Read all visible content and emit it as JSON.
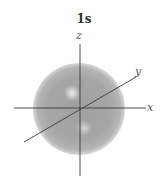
{
  "figure": {
    "title": "1s",
    "axes": {
      "x_label": "x",
      "y_label": "y",
      "z_label": "z"
    },
    "colors": {
      "sphere_edge": "#9a9a9a",
      "sphere_mid": "#a8a8a8",
      "highlight": "#e6e6e6",
      "axis_line": "#3a3a3a",
      "label": "#555555"
    }
  }
}
